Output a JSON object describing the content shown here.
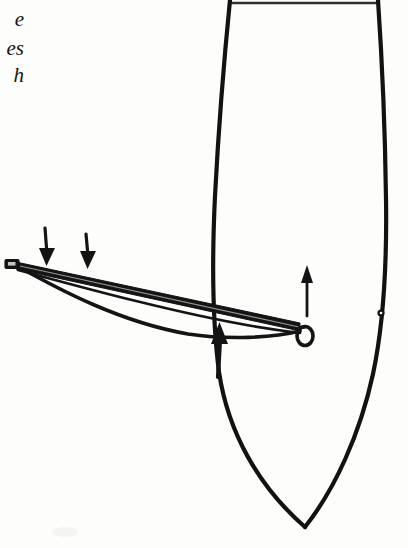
{
  "page": {
    "width": 408,
    "height": 548,
    "background_color": "#fdfdfc",
    "ink_color": "#111111",
    "kind": "scanned-book-line-drawing"
  },
  "caption": {
    "note": "Italic caption text cropped by the left page margin; only word endings are visible.",
    "lines": [
      {
        "text": "e"
      },
      {
        "text": "es"
      },
      {
        "text": "h"
      }
    ]
  },
  "figure": {
    "elements": {
      "hull_outline_label": "pointed-oval hull outline, cropped at top of page",
      "bow_stave_label": "tapered straight bow stave",
      "bow_string_label": "curved bow string",
      "nock_tip_label": "rectangular nock at left tip of stave",
      "ring_loop_label": "open ring loop at right end of stave",
      "rivet_dot_label": "small round rivet dot inside hull",
      "arrow_down_1_label": "downward annotation arrow over left stave",
      "arrow_down_2_label": "downward annotation arrow over mid stave",
      "arrow_up_junction_label": "upward annotation arrow at stave and string junction",
      "arrow_up_hull_label": "upward annotation arrow inside hull"
    }
  }
}
